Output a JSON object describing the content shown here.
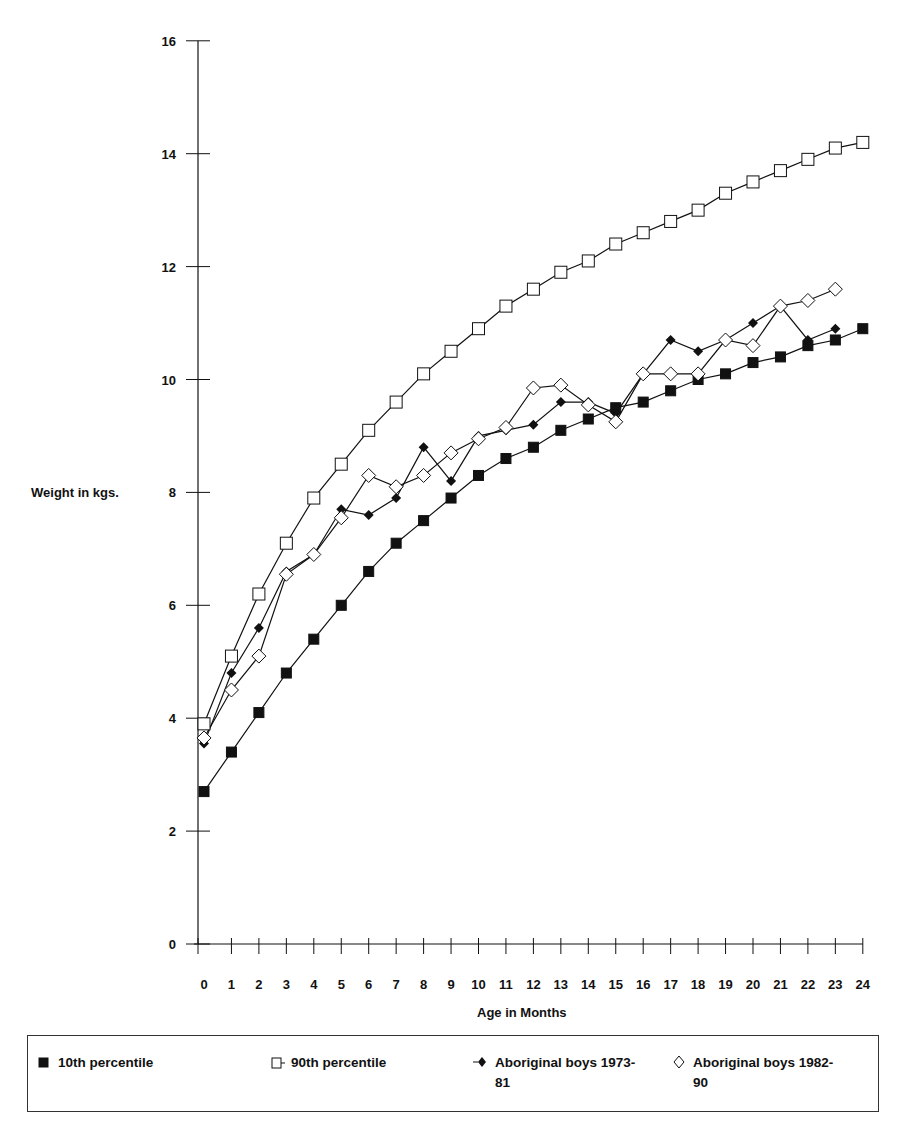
{
  "chart_data": {
    "type": "line",
    "title": "",
    "xlabel": "Age in Months",
    "ylabel": "Weight in kgs.",
    "xlim": [
      0,
      24
    ],
    "ylim": [
      0,
      16
    ],
    "x_ticks": [
      0,
      1,
      2,
      3,
      4,
      5,
      6,
      7,
      8,
      9,
      10,
      11,
      12,
      13,
      14,
      15,
      16,
      17,
      18,
      19,
      20,
      21,
      22,
      23,
      24
    ],
    "y_ticks": [
      0,
      2,
      4,
      6,
      8,
      10,
      12,
      14,
      16
    ],
    "grid": false,
    "legend_position": "bottom",
    "series": [
      {
        "name": "10th percentile",
        "marker": "filled-square",
        "x": [
          0,
          1,
          2,
          3,
          4,
          5,
          6,
          7,
          8,
          9,
          10,
          11,
          12,
          13,
          14,
          15,
          16,
          17,
          18,
          19,
          20,
          21,
          22,
          23,
          24
        ],
        "values": [
          2.7,
          3.4,
          4.1,
          4.8,
          5.4,
          6.0,
          6.6,
          7.1,
          7.5,
          7.9,
          8.3,
          8.6,
          8.8,
          9.1,
          9.3,
          9.5,
          9.6,
          9.8,
          10.0,
          10.1,
          10.3,
          10.4,
          10.6,
          10.7,
          10.9
        ]
      },
      {
        "name": "90th percentile",
        "marker": "open-square",
        "x": [
          0,
          1,
          2,
          3,
          4,
          5,
          6,
          7,
          8,
          9,
          10,
          11,
          12,
          13,
          14,
          15,
          16,
          17,
          18,
          19,
          20,
          21,
          22,
          23,
          24
        ],
        "values": [
          3.9,
          5.1,
          6.2,
          7.1,
          7.9,
          8.5,
          9.1,
          9.6,
          10.1,
          10.5,
          10.9,
          11.3,
          11.6,
          11.9,
          12.1,
          12.4,
          12.6,
          12.8,
          13.0,
          13.3,
          13.5,
          13.7,
          13.9,
          14.1,
          14.2
        ]
      },
      {
        "name": "Aboriginal boys 1973-81",
        "marker": "filled-diamond",
        "x": [
          0,
          1,
          2,
          3,
          4,
          5,
          6,
          7,
          8,
          9,
          10,
          11,
          12,
          13,
          14,
          15,
          16,
          17,
          18,
          19,
          20,
          21,
          22,
          23
        ],
        "values": [
          3.55,
          4.8,
          5.6,
          6.6,
          6.9,
          7.7,
          7.6,
          7.9,
          8.8,
          8.2,
          9.0,
          9.1,
          9.2,
          9.6,
          9.6,
          9.4,
          10.1,
          10.7,
          10.5,
          10.7,
          11.0,
          11.3,
          10.7,
          10.9
        ]
      },
      {
        "name": "Aboriginal boys 1982-90",
        "marker": "open-diamond",
        "x": [
          0,
          1,
          2,
          3,
          4,
          5,
          6,
          7,
          8,
          9,
          10,
          11,
          12,
          13,
          14,
          15,
          16,
          17,
          18,
          19,
          20,
          21,
          22,
          23
        ],
        "values": [
          3.65,
          4.5,
          5.1,
          6.55,
          6.9,
          7.55,
          8.3,
          8.1,
          8.3,
          8.7,
          8.95,
          9.15,
          9.85,
          9.9,
          9.55,
          9.25,
          10.1,
          10.1,
          10.1,
          10.7,
          10.6,
          11.3,
          11.4,
          11.6
        ]
      }
    ]
  },
  "axes": {
    "ylabel": "Weight in kgs.",
    "xlabel": "Age in Months"
  },
  "legend": {
    "items": [
      {
        "label": "10th percentile",
        "marker": "filled-square"
      },
      {
        "label": "90th percentile",
        "marker": "open-square"
      },
      {
        "label": "Aboriginal boys 1973-\n81",
        "marker": "filled-diamond"
      },
      {
        "label": "Aboriginal boys 1982-\n90",
        "marker": "open-diamond"
      }
    ]
  },
  "colors": {
    "ink": "#111111",
    "marker_fill_dark": "#111111",
    "marker_fill_open": "#ffffff",
    "background": "#ffffff"
  }
}
